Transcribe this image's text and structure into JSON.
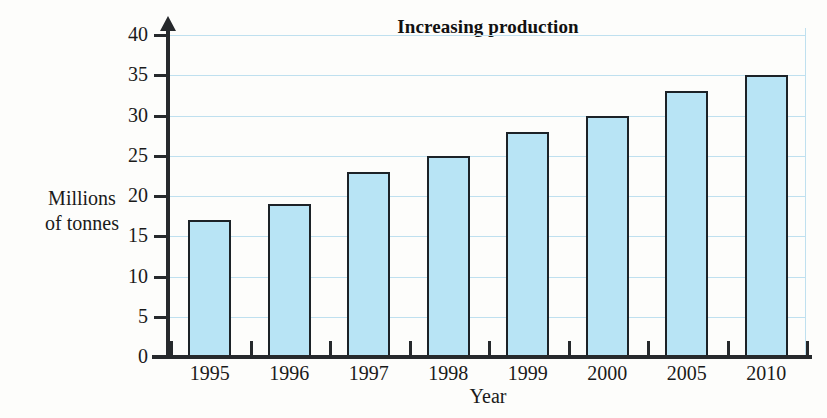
{
  "chart_data": {
    "type": "bar",
    "title": "Increasing production",
    "xlabel": "Year",
    "ylabel": "Millions of tonnes",
    "ylabel_lines": [
      "Millions",
      "of tonnes"
    ],
    "categories": [
      "1995",
      "1996",
      "1997",
      "1998",
      "1999",
      "2000",
      "2005",
      "2010"
    ],
    "values": [
      17,
      19,
      23,
      25,
      28,
      30,
      33,
      35
    ],
    "ylim": [
      0,
      40
    ],
    "ytick_step": 5,
    "yticks": [
      0,
      5,
      10,
      15,
      20,
      25,
      30,
      35,
      40
    ],
    "ytick_labels": [
      "0",
      "5",
      "10",
      "15",
      "20",
      "25",
      "30",
      "35",
      "40"
    ],
    "grid": "horizontal",
    "legend": "none",
    "series": [
      {
        "name": "Production",
        "values": [
          17,
          19,
          23,
          25,
          28,
          30,
          33,
          35
        ]
      }
    ],
    "colors": {
      "bar_fill": "#b8e4f5",
      "bar_outline": "#1c2227",
      "gridline": "#bfe0ef",
      "axis": "#26292c",
      "background": "#fdfdfb",
      "text": "#1a1a1a"
    }
  }
}
